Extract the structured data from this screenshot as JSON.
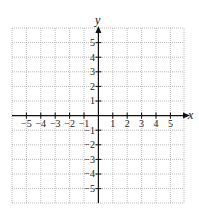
{
  "diagram": {
    "type": "coordinate-grid",
    "x_axis": {
      "label": "x",
      "ticks": [
        -5,
        -4,
        -3,
        -2,
        -1,
        1,
        2,
        3,
        4,
        5
      ],
      "range": [
        -6,
        6
      ]
    },
    "y_axis": {
      "label": "y",
      "ticks": [
        5,
        4,
        3,
        2,
        1,
        -1,
        -2,
        -3,
        -4,
        -5
      ],
      "range": [
        -6,
        6
      ]
    },
    "grid": {
      "style": "dotted",
      "color": "#9a9a9a"
    },
    "axis_color": "#111111"
  },
  "labels": {
    "x": "x",
    "y": "y",
    "xt": {
      "n5": "−5",
      "n4": "−4",
      "n3": "−3",
      "n2": "−2",
      "n1": "−1",
      "p1": "1",
      "p2": "2",
      "p3": "3",
      "p4": "4",
      "p5": "5"
    },
    "yt": {
      "p5": "5",
      "p4": "4",
      "p3": "3",
      "p2": "2",
      "p1": "1",
      "n1": "−1",
      "n2": "−2",
      "n3": "−3",
      "n4": "−4",
      "n5": "−5"
    }
  }
}
